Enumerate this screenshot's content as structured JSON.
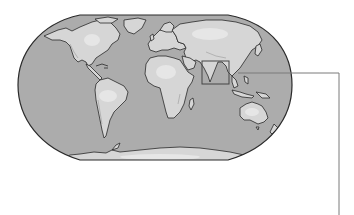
{
  "figure": {
    "type": "world-map",
    "projection": "robinson-like",
    "style": "grayscale-relief",
    "colors": {
      "background": "#ffffff",
      "ocean": "#acacac",
      "land": "#d6d6d6",
      "land_highlight": "#e4e4e4",
      "coastline": "#2a2a2a",
      "map_border": "#2a2a2a",
      "highlight_box": "#444444",
      "leader_line": "#7a7a7a"
    },
    "highlight": {
      "region": "South Asia (Indian subcontinent)",
      "box": {
        "x": 202,
        "y": 61,
        "width": 27,
        "height": 23
      }
    },
    "leader_line": {
      "points": [
        [
          238,
          73
        ],
        [
          339,
          73
        ],
        [
          339,
          215
        ]
      ]
    }
  }
}
